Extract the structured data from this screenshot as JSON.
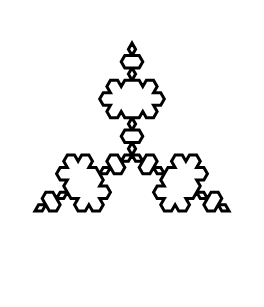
{
  "image": {
    "title": "Koch Snowflake",
    "kind": "line-drawing",
    "description": "Koch snowflake fractal outline",
    "width": 264,
    "height": 307
  },
  "figure": {
    "name": "koch-snowflake",
    "type": "fractal-curve",
    "iterations": 3,
    "sides": 3,
    "segment_count": 192,
    "stroke_color": "#000000",
    "fill_color": "none",
    "background_color": "#ffffff",
    "stroke_width": 3,
    "center_x": 132,
    "center_y": 155,
    "bounds": {
      "min_x": 11,
      "min_y": 18,
      "max_x": 253,
      "max_y": 292
    },
    "extreme_points": {
      "top_apex": [
        133,
        18
      ],
      "bottom_apex": [
        136,
        292
      ],
      "left_spike": [
        11,
        133
      ],
      "right_spike": [
        253,
        128
      ]
    },
    "base_triangle": {
      "circumradius": 112,
      "rotation_degrees": -90,
      "vertices": [
        [
          132,
          43
        ],
        [
          229,
          211
        ],
        [
          35,
          211
        ]
      ]
    }
  }
}
